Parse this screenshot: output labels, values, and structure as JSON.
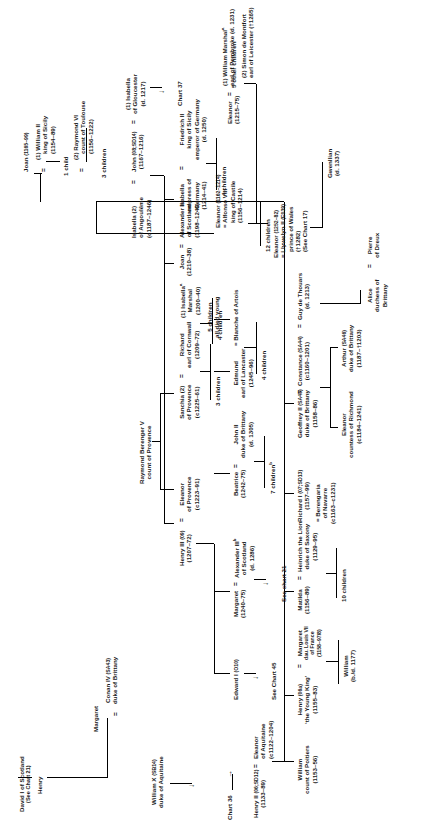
{
  "chart": {
    "cross_references": {
      "chart36": "Chart 36",
      "chart37": "Chart 37",
      "chart45": "See Chart 45",
      "chart21_alexander": "See chart 21",
      "chart21_david": "(See Chart 21)",
      "chart17": "(See Chart 17)"
    },
    "equals": "=",
    "arrow": "→"
  },
  "people": {
    "david_i": {
      "name": "David I of Scotland",
      "ref": "(See Chart 21)"
    },
    "henry_son_david": {
      "name": "Henry"
    },
    "margaret_conan": {
      "name": "Margaret"
    },
    "william_x": {
      "name": "William X",
      "code": "(SB14)",
      "title": "duke of Aquitaine"
    },
    "eleanor_aquitaine": {
      "name": "Eleanor",
      "title": "of Aquitaine",
      "dates": "(c1122–1204)"
    },
    "henry_ii": {
      "name": "Henry II",
      "code": "(06;SD12)",
      "dates": "(1133–89)"
    },
    "william_poitiers": {
      "name": "William",
      "title": "count of Poitiers",
      "dates": "(1153–56)"
    },
    "henry_young_king": {
      "name": "Henry",
      "code": "(06a)",
      "title": "‘the Young King’",
      "dates": "(1155–83)"
    },
    "margaret_france": {
      "name": "Margaret",
      "desc": "dau. Louis VII",
      "desc2": "of France",
      "dates": "(1158–97/8)"
    },
    "william_bd1177": {
      "name": "William",
      "dates": "(b./d. 1177)"
    },
    "matilda": {
      "name": "Matilda",
      "dates": "(1156–89)"
    },
    "heinrich_lion": {
      "name": "Heinrich the Lion",
      "title": "duke of Saxony",
      "dates": "(1129–95)"
    },
    "children_10": {
      "label": "10 children"
    },
    "richard_i": {
      "name": "Richard I",
      "code": "(07;SD13)",
      "dates": "(1157–99)"
    },
    "berengaria": {
      "name": "Berengaria",
      "title": "of Navarre",
      "dates": "(c1163–c1231)"
    },
    "geoffrey_ii": {
      "name": "Geoffrey II",
      "code": "(SA45)",
      "title": "duke of Brittany",
      "dates": "(1158–86)"
    },
    "constance": {
      "name": "Constance",
      "code": "(SA44)",
      "dates": "(c1160–1201)"
    },
    "conan_iv": {
      "name": "Conan IV",
      "code": "(SA43)",
      "title": "duke of Brittany"
    },
    "guy_de_thouars": {
      "name": "Guy de Thouars",
      "dates": "(d. 1213)"
    },
    "eleanor_richmond": {
      "name": "Eleanor",
      "title": "countess of Richmond",
      "dates": "(c1184–1241)"
    },
    "arthur": {
      "name": "Arthur",
      "code": "(SA46)",
      "title": "duke of Brittany",
      "dates": "(1187–†1203)"
    },
    "alice_brittany": {
      "name": "Alice",
      "title": "duchess of",
      "title2": "Brittany"
    },
    "pierre_dreux": {
      "name": "Pierre",
      "title": "of Dreux"
    },
    "eleanor_castile_dau": {
      "name": "Eleanor",
      "dates": "(1162–1214)"
    },
    "alfonso_viii": {
      "name": "Alfonso VIII",
      "title": "king of Castile",
      "dates": "(1156–1214)"
    },
    "children_12": {
      "label": "12 children"
    },
    "joan_sicily": {
      "name": "Joan",
      "dates": "(1165–99)"
    },
    "william_ii_sicily": {
      "name": "(1) William II",
      "title": "king of Sicily",
      "dates": "(1154–89)"
    },
    "child_1": {
      "label": "1 child"
    },
    "raymond_vi": {
      "name": "(2) Raymond VI",
      "title": "count of Toulouse",
      "dates": "(1156–1222)"
    },
    "children_3_toulouse": {
      "label": "3 children"
    },
    "john": {
      "name": "John",
      "code": "(08;SD14)",
      "dates": "(1167–1216)"
    },
    "isabella_gloucester": {
      "name": "(1) Isabella",
      "title": "of Gloucester",
      "dates": "(d. 1217)"
    },
    "isabella_angouleme": {
      "name": "Isabella (2)",
      "title": "of Angoulême",
      "dates": "(c1187–1246)"
    },
    "henry_iii": {
      "name": "Henry III",
      "code": "(09)",
      "dates": "(1207–72)"
    },
    "eleanor_provence": {
      "name": "Eleanor",
      "title": "of Provence",
      "dates": "(c1223–91)"
    },
    "raymond_berenger_v": {
      "name": "Raymond Berenger V",
      "title": "count of Provence"
    },
    "sanchia": {
      "name": "Sanchia (2)",
      "title": "of Provence",
      "dates": "(c1225–61)"
    },
    "richard_cornwall": {
      "name": "Richard",
      "title": "earl of Cornwall",
      "dates": "(1209–72)"
    },
    "children_3_sanchia": {
      "label": "3 children"
    },
    "isabella_marshal": {
      "name": "(1) Isabella",
      "sup": "a",
      "title": "Marshal",
      "dates": "(1200–40)"
    },
    "children_4_marshal": {
      "label": "4 children"
    },
    "joan_scotland": {
      "name": "Joan",
      "dates": "(1210–38)"
    },
    "alexander_ii": {
      "name": "Alexander II",
      "title": "of Scotland",
      "dates": "(1198–1249)"
    },
    "isabella_germany": {
      "name": "Isabella",
      "title": "empress of",
      "title2": "Germany",
      "dates": "(1214–41)"
    },
    "friedrich_ii": {
      "name": "Friedrich II",
      "title": "king of Sicily",
      "title2": "emperor of Germany",
      "dates": "(d. 1250)"
    },
    "children_4_germany": {
      "label": "4 children"
    },
    "eleanor_1215": {
      "name": "Eleanor",
      "dates": "(1215–75)"
    },
    "william_marshal": {
      "name": "(1) William Marshal",
      "sup": "a",
      "title": "earl of Pembroke",
      "dates": "(d. 1231)"
    },
    "simon_de_montfort": {
      "name": "(2) Simon de Montfort",
      "title": "earl of Leicester",
      "dates": "(†1265)"
    },
    "children_5_other": {
      "label": "5 other children"
    },
    "edward_i": {
      "name": "Edward I",
      "code": "(O10)"
    },
    "margaret_1240": {
      "name": "Margaret",
      "dates": "(1240–75)"
    },
    "alexander_iii": {
      "name": "Alexander III",
      "sup": "b",
      "title": "of Scotland",
      "dates": "(d. 1286)"
    },
    "beatrice": {
      "name": "Beatrice",
      "dates": "(1242–75)"
    },
    "john_ii_brittany": {
      "name": "John II",
      "title": "duke of Brittany",
      "dates": "(d. 1305)"
    },
    "children_7": {
      "label": "7 children",
      "sup": "b"
    },
    "edmund_lancaster": {
      "name": "Edmund",
      "title": "earl of Lancaster",
      "dates": "(1245–96)"
    },
    "blanche_artois": {
      "name": "Blanche of Artois"
    },
    "children_4_blanche": {
      "label": "4 children"
    },
    "children_5_died": {
      "label": "5 children",
      "label2": "all died young"
    },
    "eleanor_1252": {
      "name": "Eleanor",
      "dates": "(1252–82)"
    },
    "llywelyn_ii": {
      "name": "Llywelyn II",
      "code": "(E039)",
      "title": "prince of Wales",
      "dates": "(†1282)",
      "ref": "(See Chart 17)"
    },
    "gwenllian": {
      "name": "Gwenllian",
      "dates": "(d. 1337)"
    }
  }
}
